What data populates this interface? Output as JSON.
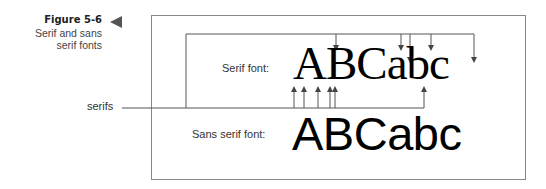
{
  "caption": {
    "figure_number": "Figure 5-6",
    "title_line1": "Serif and sans",
    "title_line2": "serif fonts"
  },
  "diagram": {
    "callout_label": "serifs",
    "serif_row": {
      "label": "Serif font:",
      "sample": "ABCabc"
    },
    "sans_serif_row": {
      "label": "Sans serif font:",
      "sample": "ABCabc"
    },
    "arrows": {
      "top_bracket_down_arrow_x": [
        336,
        401,
        410,
        431,
        474
      ],
      "bottom_bracket_up_arrow_x": [
        294,
        304,
        318,
        330,
        335,
        424
      ]
    }
  },
  "colors": {
    "line": "#555555",
    "frame": "#888888",
    "text": "#333333",
    "sample": "#000000"
  }
}
